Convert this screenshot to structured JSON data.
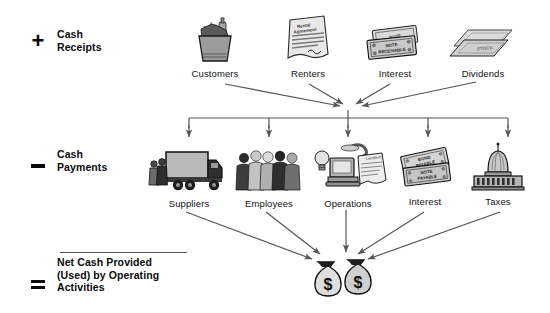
{
  "diagram": {
    "background_color": "#ffffff",
    "line_color": "#555555",
    "text_color": "#0a0a0a"
  },
  "rows": {
    "receipts": {
      "sign": "+",
      "sign_name": "plus-sign",
      "label_line1": "Cash",
      "label_line2": "Receipts",
      "items": [
        {
          "label": "Customers",
          "icon": "grocery-bag-icon"
        },
        {
          "label": "Renters",
          "icon": "rental-agreement-icon"
        },
        {
          "label": "Interest",
          "icon": "note-receivable-icon"
        },
        {
          "label": "Dividends",
          "icon": "stock-certificate-icon"
        }
      ]
    },
    "payments": {
      "sign": "–",
      "sign_name": "minus-sign",
      "label_line1": "Cash",
      "label_line2": "Payments",
      "items": [
        {
          "label": "Suppliers",
          "icon": "delivery-truck-icon"
        },
        {
          "label": "Employees",
          "icon": "employees-group-icon"
        },
        {
          "label": "Operations",
          "icon": "computer-operations-icon"
        },
        {
          "label": "Interest",
          "icon": "bond-payable-icon"
        },
        {
          "label": "Taxes",
          "icon": "capitol-building-icon"
        }
      ]
    },
    "result": {
      "sign": "=",
      "sign_name": "equals-sign",
      "label_line1": "Net Cash Provided",
      "label_line2": "(Used) by Operating",
      "label_line3": "Activities",
      "icon": "money-bags-icon",
      "money_symbol": "$",
      "money_bag_count": 2
    }
  },
  "icon_text": {
    "rental_agreement_line1": "Rental",
    "rental_agreement_line2": "Agreement",
    "note_receivable_front": "NOTE RECEIVABLE",
    "note_receivable_back": "NOTE",
    "stock_certificate": "STOCK",
    "bond_payable": "BOND PAYABLE",
    "note_payable": "NOTE PAYABLE",
    "operations_invoice": "Landlord"
  }
}
